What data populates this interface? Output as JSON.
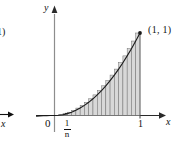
{
  "figure": {
    "name": "riemann-sum-under-power-curve",
    "background_color": "#ffffff",
    "ink_color": "#111111",
    "rect_fill_color": "#d8d8d8",
    "rect_stroke_color": "#6e6e6e",
    "curve_color": "#1a1a1a"
  },
  "axes": {
    "y_axis_label": "y",
    "x_axis_label": "x",
    "origin_label": "0",
    "x_tick_label_one": "1",
    "x_tick_label_fraction_numerator": "1",
    "x_tick_label_fraction_denominator": "n"
  },
  "annotations": {
    "corner_point_label": "(1, 1)"
  },
  "fragments": {
    "left_clipped_paren_label": "1)",
    "left_clipped_axis_label": "x"
  },
  "chart_data": {
    "type": "area",
    "title": "",
    "xlabel": "x",
    "ylabel": "y",
    "xlim": [
      -0.12,
      1.15
    ],
    "ylim": [
      -0.06,
      1.2
    ],
    "grid": false,
    "legend": null,
    "curve": {
      "name": "y = x^2",
      "exponent": 2,
      "x": [
        0.0,
        0.05,
        0.1,
        0.15,
        0.2,
        0.25,
        0.3,
        0.35,
        0.4,
        0.45,
        0.5,
        0.55,
        0.6,
        0.65,
        0.7,
        0.75,
        0.8,
        0.85,
        0.9,
        0.95,
        1.0
      ],
      "y": [
        0.0,
        0.0025,
        0.01,
        0.0225,
        0.04,
        0.0625,
        0.09,
        0.1225,
        0.16,
        0.2025,
        0.25,
        0.3025,
        0.36,
        0.4225,
        0.49,
        0.5625,
        0.64,
        0.7225,
        0.81,
        0.9025,
        1.0
      ]
    },
    "rectangles": {
      "method": "right-endpoint",
      "count": 20,
      "width": 0.05,
      "right_endpoints": [
        0.05,
        0.1,
        0.15,
        0.2,
        0.25,
        0.3,
        0.35,
        0.4,
        0.45,
        0.5,
        0.55,
        0.6,
        0.65,
        0.7,
        0.75,
        0.8,
        0.85,
        0.9,
        0.95,
        1.0
      ],
      "heights": [
        0.0025,
        0.01,
        0.0225,
        0.04,
        0.0625,
        0.09,
        0.1225,
        0.16,
        0.2025,
        0.25,
        0.3025,
        0.36,
        0.4225,
        0.49,
        0.5625,
        0.64,
        0.7225,
        0.81,
        0.9025,
        1.0
      ]
    },
    "marked_points": [
      {
        "label": "(1, 1)",
        "x": 1.0,
        "y": 1.0
      }
    ],
    "tick_labels": {
      "x": [
        "0",
        "1/n",
        "1"
      ],
      "y": []
    }
  }
}
